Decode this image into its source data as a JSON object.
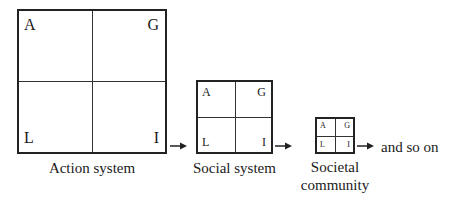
{
  "diagram": {
    "systems": [
      {
        "name": "Action system",
        "quadrants": {
          "tl": "A",
          "tr": "G",
          "bl": "L",
          "br": "I"
        }
      },
      {
        "name": "Social system",
        "quadrants": {
          "tl": "A",
          "tr": "G",
          "bl": "L",
          "br": "I"
        }
      },
      {
        "name_line1": "Societal",
        "name_line2": "community",
        "quadrants": {
          "tl": "A",
          "tr": "G",
          "bl": "L",
          "br": "I"
        }
      }
    ],
    "trailing_text": "and so on",
    "arrow_icon": "right-arrow-icon"
  }
}
